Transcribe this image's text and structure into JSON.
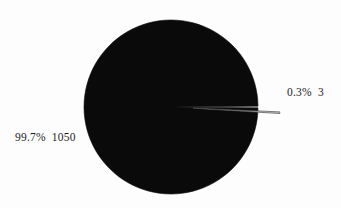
{
  "chart_data": {
    "type": "pie",
    "title": "",
    "subtitle": "",
    "xlabel": "",
    "ylabel": "",
    "grid": false,
    "legend_position": "none",
    "labels_position": "outside",
    "total": 1053,
    "categories": [
      "1050",
      "3"
    ],
    "values": [
      1050,
      3
    ],
    "percentages": [
      99.7,
      0.3
    ],
    "slices": [
      {
        "name": "major-slice",
        "value": 1050,
        "percent": 99.7,
        "percent_text": "99.7%",
        "value_text": "1050",
        "label": "99.7%  1050",
        "color": "#0a0a0a",
        "exploded": false
      },
      {
        "name": "minor-slice",
        "value": 3,
        "percent": 0.3,
        "percent_text": "0.3%",
        "value_text": "3",
        "label": "0.3%  3",
        "color": "#c8c8c8",
        "exploded": true
      }
    ],
    "colors": {
      "major": "#0a0a0a",
      "minor": "#c8c8c8",
      "outline": "#3a3a3a",
      "background": "#fdfdfd",
      "label_text": "#1c1c1c"
    },
    "geometry": {
      "center_x": 171,
      "center_y": 107,
      "radius": 87,
      "start_angle_deg": 0,
      "minor_slice_explode_px": 22
    }
  },
  "labels": {
    "major": "99.7%  1050",
    "minor": "0.3%  3"
  }
}
